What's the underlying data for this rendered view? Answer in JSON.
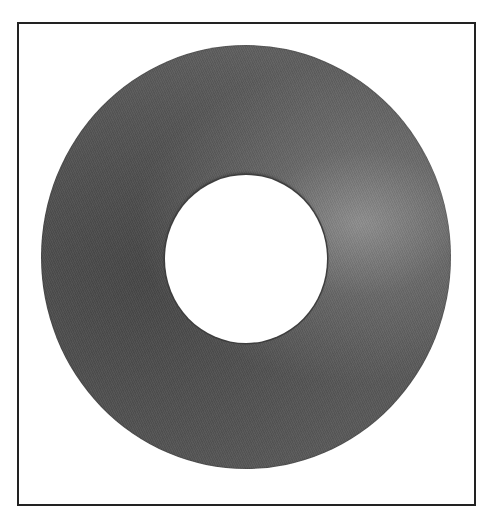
{
  "image": {
    "subject": "flat washer",
    "description": "Gray flat washer (annulus) with a central circular hole, shown inside a thin dark rectangular frame on white background",
    "colors": {
      "background": "#ffffff",
      "frame_border": "#222222",
      "washer_dark": "#4d4d4d",
      "washer_mid": "#5a5a5a",
      "washer_highlight": "#8a8a8a",
      "hole": "#ffffff"
    }
  }
}
